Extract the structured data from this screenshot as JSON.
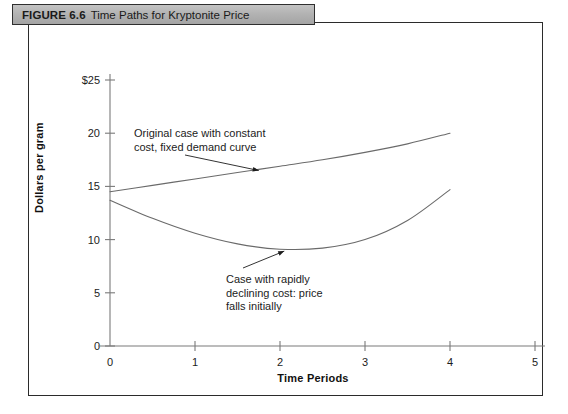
{
  "figure": {
    "number_label": "FIGURE 6.6",
    "title": "Time Paths for Kryptonite Price"
  },
  "chart_data": {
    "type": "line",
    "title": "Time Paths for Kryptonite Price",
    "xlabel": "Time Periods",
    "ylabel": "Dollars per gram",
    "xlim": [
      0,
      5
    ],
    "ylim": [
      0,
      25
    ],
    "xticks": [
      "0",
      "1",
      "2",
      "3",
      "4",
      "5"
    ],
    "yticks": [
      "0",
      "5",
      "10",
      "15",
      "20",
      "$25"
    ],
    "grid": false,
    "legend": "none",
    "series": [
      {
        "name": "Original case with constant cost, fixed demand curve",
        "x": [
          0,
          0.5,
          1,
          1.5,
          2,
          2.5,
          3,
          3.5,
          4
        ],
        "values": [
          14.5,
          15.1,
          15.7,
          16.3,
          16.9,
          17.5,
          18.2,
          19.0,
          20.0
        ]
      },
      {
        "name": "Case with rapidly declining cost: price falls initially",
        "x": [
          0,
          0.5,
          1,
          1.5,
          2,
          2.5,
          3,
          3.5,
          4
        ],
        "values": [
          13.7,
          12.0,
          10.6,
          9.6,
          9.1,
          9.2,
          10.0,
          11.8,
          14.7
        ]
      }
    ],
    "annotations": [
      {
        "id": "upper-curve-note",
        "text": "Original case with constant\ncost, fixed demand curve",
        "arrow_to": {
          "x": 1.75,
          "y": 16.4
        }
      },
      {
        "id": "lower-curve-note",
        "text": "Case with rapidly\ndeclining cost: price\nfalls initially",
        "arrow_to": {
          "x": 2.05,
          "y": 9.2
        }
      }
    ]
  },
  "axes": {
    "y_ticks": [
      {
        "label": "$25",
        "value": 25
      },
      {
        "label": "20",
        "value": 20
      },
      {
        "label": "15",
        "value": 15
      },
      {
        "label": "10",
        "value": 10
      },
      {
        "label": "5",
        "value": 5
      },
      {
        "label": "0",
        "value": 0
      }
    ],
    "x_ticks": [
      {
        "label": "0",
        "value": 0
      },
      {
        "label": "1",
        "value": 1
      },
      {
        "label": "2",
        "value": 2
      },
      {
        "label": "3",
        "value": 3
      },
      {
        "label": "4",
        "value": 4
      },
      {
        "label": "5",
        "value": 5
      }
    ]
  },
  "colors": {
    "header_bar": "#b3b3b3",
    "frame_border": "#2b2b2b",
    "curve": "#6a6a6a",
    "axis": "#7a7a7a",
    "text": "#1c1c1c"
  }
}
